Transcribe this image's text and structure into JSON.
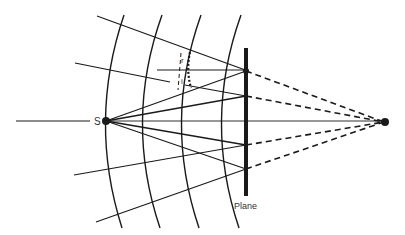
{
  "diagram": {
    "labels": {
      "source": "S",
      "plane": "Plane",
      "reflected_angle": "r",
      "incident_angle": "i"
    },
    "colors": {
      "line": "#1a1a1a",
      "background": "#ffffff",
      "text": "#333333"
    },
    "source_point": {
      "x": 106,
      "y": 121
    },
    "image_point": {
      "x": 384,
      "y": 122
    },
    "plane": {
      "x": 246,
      "y1": 48,
      "y2": 196
    },
    "plane_hits_y": [
      71,
      96,
      121,
      145,
      169
    ]
  }
}
